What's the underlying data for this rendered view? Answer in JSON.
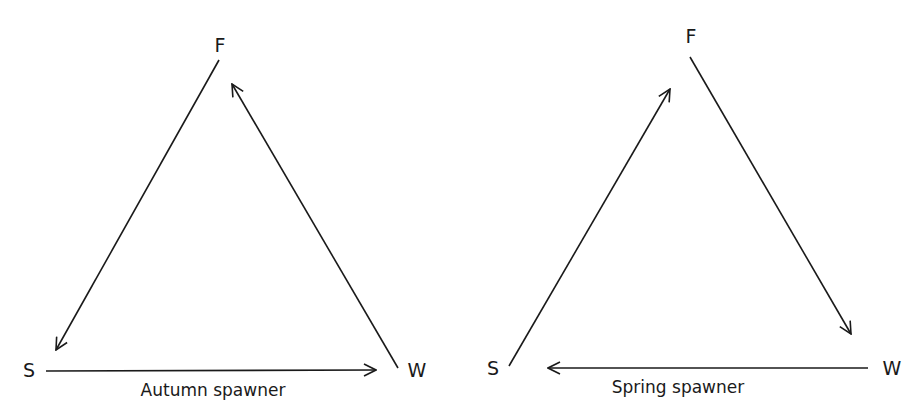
{
  "diagrams": [
    {
      "id": "autumn",
      "caption": "Autumn spawner",
      "nodes": {
        "F": {
          "label": "F"
        },
        "S": {
          "label": "S"
        },
        "W": {
          "label": "W"
        }
      },
      "edges": [
        {
          "from": "F",
          "to": "S"
        },
        {
          "from": "S",
          "to": "W"
        },
        {
          "from": "W",
          "to": "F"
        }
      ]
    },
    {
      "id": "spring",
      "caption": "Spring spawner",
      "nodes": {
        "F": {
          "label": "F"
        },
        "S": {
          "label": "S"
        },
        "W": {
          "label": "W"
        }
      },
      "edges": [
        {
          "from": "S",
          "to": "F"
        },
        {
          "from": "F",
          "to": "W"
        },
        {
          "from": "W",
          "to": "S"
        }
      ]
    }
  ],
  "colors": {
    "ink": "#1a1a1a",
    "background": "#ffffff"
  }
}
